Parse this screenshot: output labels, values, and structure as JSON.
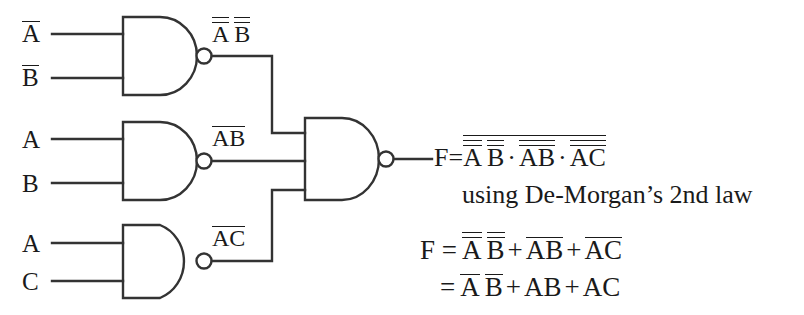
{
  "diagram": {
    "line_color": "#333333",
    "background_color": "#ffffff"
  },
  "gates": [
    {
      "id": "gate-1",
      "type": "nand",
      "inputs": [
        "A",
        "B"
      ],
      "input_overbars": [
        1,
        1
      ],
      "output_label": {
        "a": "A",
        "b": "B",
        "bars": 2
      }
    },
    {
      "id": "gate-2",
      "type": "nand",
      "inputs": [
        "A",
        "B"
      ],
      "input_overbars": [
        0,
        0
      ],
      "output_label": {
        "a": "A",
        "b": "B",
        "bars": 1
      }
    },
    {
      "id": "gate-3",
      "type": "nand",
      "inputs": [
        "A",
        "C"
      ],
      "input_overbars": [
        0,
        0
      ],
      "output_label": {
        "a": "A",
        "b": "C",
        "bars": 1
      }
    },
    {
      "id": "gate-out",
      "type": "nand",
      "inputs": [
        "gate-1",
        "gate-2",
        "gate-3"
      ],
      "output_label": "F"
    }
  ],
  "labels": {
    "g1_in1": "A",
    "g1_in2": "B",
    "g2_in1": "A",
    "g2_in2": "B",
    "g3_in1": "A",
    "g3_in2": "C",
    "g1_out_a": "A",
    "g1_out_b": "B",
    "g2_out": "AB",
    "g3_out": "AC"
  },
  "equations": {
    "f_prefix": "F=",
    "line1": {
      "term1_a": "A",
      "term1_b": "B",
      "dot1": "·",
      "term2": "AB",
      "dot2": "·",
      "term3": "AC"
    },
    "note": "using De-Morgan’s 2nd law",
    "line2": {
      "prefix": "F =",
      "term1_a": "A",
      "term1_b": "B",
      "plus1": "+",
      "term2": "AB",
      "plus2": "+",
      "term3": "AC"
    },
    "line3": {
      "prefix": "=",
      "term1_a": "A",
      "term1_b": "B",
      "plus1": "+",
      "term2": "AB",
      "plus2": "+",
      "term3": "AC"
    }
  }
}
